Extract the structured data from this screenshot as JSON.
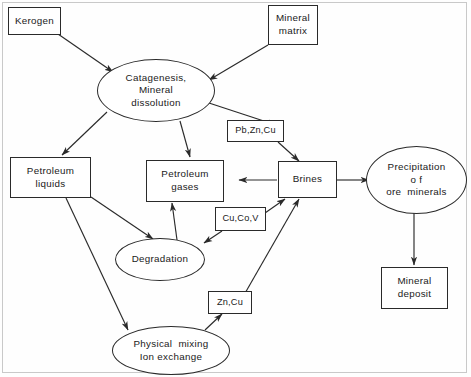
{
  "diagram": {
    "stroke_color": "#2a2a2a",
    "background_color": "#fefefe",
    "text_color": "#1a1a1a",
    "nodes": [
      {
        "id": "kerogen",
        "shape": "box",
        "lines": [
          "Kerogen"
        ]
      },
      {
        "id": "mineral-matrix",
        "shape": "box",
        "lines": [
          "Mineral",
          "matrix"
        ]
      },
      {
        "id": "catagenesis",
        "shape": "ellipse",
        "lines": [
          "Catagenesis,",
          "Mineral",
          "dissolution"
        ]
      },
      {
        "id": "pb-zn-cu",
        "shape": "box",
        "lines": [
          "Pb,Zn,Cu"
        ]
      },
      {
        "id": "petroleum-liquids",
        "shape": "box",
        "lines": [
          "Petroleum",
          "liquids"
        ]
      },
      {
        "id": "petroleum-gases",
        "shape": "box",
        "lines": [
          "Petroleum",
          "gases"
        ]
      },
      {
        "id": "brines",
        "shape": "box",
        "lines": [
          "Brines"
        ]
      },
      {
        "id": "precipitation",
        "shape": "ellipse",
        "lines": [
          "Precipitation",
          "o f",
          "ore  minerals"
        ]
      },
      {
        "id": "cu-co-v",
        "shape": "box",
        "lines": [
          "Cu,Co,V"
        ]
      },
      {
        "id": "degradation",
        "shape": "ellipse",
        "lines": [
          "Degradation"
        ]
      },
      {
        "id": "zn-cu",
        "shape": "box",
        "lines": [
          "Zn,Cu"
        ]
      },
      {
        "id": "physical-mixing",
        "shape": "ellipse",
        "lines": [
          "Physical  mixing",
          "Ion exchange"
        ]
      },
      {
        "id": "mineral-deposit",
        "shape": "box",
        "lines": [
          "Mineral",
          "deposit"
        ]
      }
    ],
    "edges": [
      {
        "from": "kerogen",
        "to": "catagenesis",
        "arrow": true
      },
      {
        "from": "mineral-matrix",
        "to": "catagenesis",
        "arrow": true
      },
      {
        "from": "catagenesis",
        "to": "petroleum-liquids",
        "arrow": true
      },
      {
        "from": "catagenesis",
        "to": "petroleum-gases",
        "arrow": true
      },
      {
        "from": "catagenesis",
        "to": "pb-zn-cu",
        "arrow": true
      },
      {
        "from": "pb-zn-cu",
        "to": "brines",
        "arrow": true
      },
      {
        "from": "brines",
        "to": "petroleum-gases",
        "arrow": true
      },
      {
        "from": "brines",
        "to": "precipitation",
        "arrow": true
      },
      {
        "from": "petroleum-liquids",
        "to": "degradation",
        "arrow": true
      },
      {
        "from": "petroleum-liquids",
        "to": "physical-mixing",
        "arrow": true
      },
      {
        "from": "degradation",
        "to": "petroleum-gases",
        "arrow": true
      },
      {
        "from": "cu-co-v",
        "to": "degradation",
        "arrow": true
      },
      {
        "from": "cu-co-v",
        "to": "brines",
        "arrow": true
      },
      {
        "from": "zn-cu",
        "to": "brines",
        "arrow": true
      },
      {
        "from": "physical-mixing",
        "to": "zn-cu",
        "arrow": true
      },
      {
        "from": "precipitation",
        "to": "mineral-deposit",
        "arrow": true
      }
    ]
  }
}
